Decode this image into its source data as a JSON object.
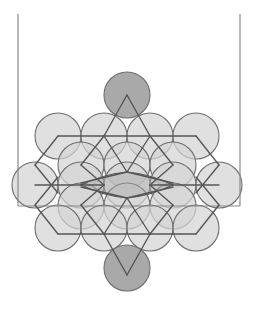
{
  "figure": {
    "canvas": {
      "width": 253,
      "height": 309,
      "background": "#ffffff"
    },
    "colors": {
      "circle_light_fill": "#d4d4d4",
      "circle_dark_fill": "#a9a9a9",
      "circle_stroke": "#6e6e6e",
      "lattice_stroke": "#555555",
      "frame_stroke": "#8a8a8a",
      "background": "#ffffff"
    },
    "container": {
      "name": "open-top-container",
      "left_wall": {
        "x": 18,
        "y_top": 14,
        "y_bottom": 207
      },
      "right_wall": {
        "x": 240,
        "y_top": 14,
        "y_bottom": 207
      },
      "floor": {
        "y": 206,
        "x_left": 18,
        "x_right": 240
      }
    },
    "packing": {
      "radius": 23,
      "h_spacing": 46,
      "v_spacing": 40.5,
      "rows": [
        {
          "row": 0,
          "cy": 95,
          "shade": "dark",
          "centers_x": [
            127
          ]
        },
        {
          "row": 1,
          "cy": 136,
          "shade": "light",
          "centers_x": [
            58,
            104,
            150,
            196
          ]
        },
        {
          "row": 2,
          "cy": 165,
          "shade": "light",
          "centers_x": [
            81,
            127,
            173
          ]
        },
        {
          "row": 3,
          "cy": 185,
          "shade": "light",
          "centers_x": [
            35,
            81,
            127,
            173,
            219
          ]
        },
        {
          "row": 4,
          "cy": 206,
          "shade": "light",
          "centers_x": [
            81,
            127,
            173
          ]
        },
        {
          "row": 5,
          "cy": 228,
          "shade": "light",
          "centers_x": [
            58,
            104,
            150,
            196
          ]
        },
        {
          "row": 6,
          "cy": 268,
          "shade": "dark",
          "centers_x": [
            127
          ]
        }
      ],
      "circle_count_light": 22,
      "circle_count_dark": 2
    },
    "lattice": {
      "description": "rhombic / hexagonal bond network connecting packed circle centers",
      "nodes": [
        [
          127,
          95
        ],
        [
          104,
          136
        ],
        [
          150,
          136
        ],
        [
          58,
          136
        ],
        [
          196,
          136
        ],
        [
          35,
          185
        ],
        [
          81,
          185
        ],
        [
          127,
          185
        ],
        [
          173,
          185
        ],
        [
          219,
          185
        ],
        [
          58,
          228
        ],
        [
          104,
          228
        ],
        [
          150,
          228
        ],
        [
          196,
          228
        ],
        [
          127,
          268
        ],
        [
          81,
          160
        ],
        [
          173,
          160
        ],
        [
          81,
          210
        ],
        [
          173,
          210
        ],
        [
          104,
          185
        ],
        [
          150,
          185
        ]
      ],
      "edge_count": 34
    },
    "labels": {
      "caption": ""
    }
  }
}
